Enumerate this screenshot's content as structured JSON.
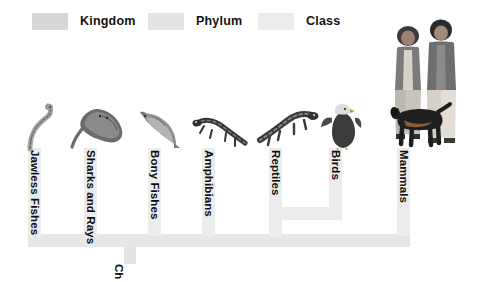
{
  "figure": {
    "type": "cladogram"
  },
  "legend": {
    "items": [
      {
        "label": "Kingdom",
        "color": "#d7d7d7",
        "icon": "kingdom-swatch"
      },
      {
        "label": "Phylum",
        "color": "#e4e4e4",
        "icon": "phylum-swatch"
      },
      {
        "label": "Class",
        "color": "#ececec",
        "icon": "class-swatch"
      }
    ]
  },
  "tree": {
    "trunk_color": "#e6e6e6",
    "branch_color": "#ececec",
    "phylum_stem_label": "Ch",
    "branches": [
      {
        "id": "jawless-fishes",
        "label": "Jawless Fishes",
        "organism": "lamprey-illustration",
        "x": 36,
        "label_x": 33,
        "label_y": 152,
        "stem_top": 148
      },
      {
        "id": "sharks-and-rays",
        "label": "Sharks and Rays",
        "organism": "stingray-illustration",
        "x": 92,
        "label_x": 89,
        "label_y": 152,
        "stem_top": 148
      },
      {
        "id": "bony-fishes",
        "label": "Bony Fishes",
        "organism": "bony-fish-illustration",
        "x": 156,
        "label_x": 153,
        "label_y": 152,
        "stem_top": 148
      },
      {
        "id": "amphibians",
        "label": "Amphibians",
        "organism": "salamander-illustration",
        "x": 210,
        "label_x": 207,
        "label_y": 152,
        "stem_top": 148
      },
      {
        "id": "reptiles",
        "label": "Reptiles",
        "organism": "lizard-illustration",
        "x": 277,
        "label_x": 274,
        "label_y": 152,
        "stem_top": 148
      },
      {
        "id": "birds",
        "label": "Birds",
        "organism": "eagle-illustration",
        "x": 337,
        "label_x": 334,
        "label_y": 152,
        "stem_top": 148
      },
      {
        "id": "mammals",
        "label": "Mammals",
        "organism": "humans-and-dog-illustration",
        "x": 400,
        "label_x": 397,
        "label_y": 152,
        "stem_top": 148
      }
    ],
    "nodes": [
      {
        "id": "reptiles-birds-node",
        "joins": [
          "reptiles",
          "birds"
        ],
        "y": 208
      },
      {
        "id": "vertebrate-trunk",
        "joins": [
          "jawless-fishes",
          "sharks-and-rays",
          "bony-fishes",
          "amphibians",
          "reptiles-birds-node",
          "mammals"
        ],
        "y": 238
      }
    ]
  }
}
